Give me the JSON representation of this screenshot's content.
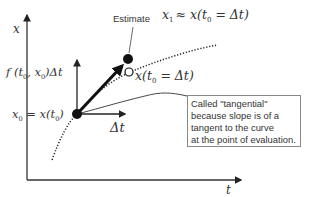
{
  "diagram": {
    "axes": {
      "y_label": "x",
      "x_label": "t"
    },
    "labels": {
      "estimate": "Estimate",
      "estimate_formula_lhs": "x",
      "estimate_formula_sub": "1",
      "estimate_formula_rhs": "≈ x(t",
      "estimate_formula_sub0": "0",
      "estimate_formula_tail": " = Δt)",
      "true_value_prefix": "x(t",
      "true_value_sub": "0",
      "true_value_tail": " = Δt)",
      "slope_term_prefix": "f (t",
      "slope_term_sub1": "0",
      "slope_term_mid": ", x",
      "slope_term_sub2": "0",
      "slope_term_tail": ")Δt",
      "x0_prefix": "x",
      "x0_sub": "0",
      "x0_mid": " = x(t",
      "x0_sub2": "0",
      "x0_tail": ")",
      "delta_t": "Δt"
    },
    "callout": {
      "lines": [
        "Called \"tangential\"",
        "because slope is of a",
        "tangent to the curve",
        "at the point of evaluation."
      ]
    },
    "colors": {
      "ink": "#111111",
      "text": "#333333",
      "box_border": "#888888"
    }
  }
}
